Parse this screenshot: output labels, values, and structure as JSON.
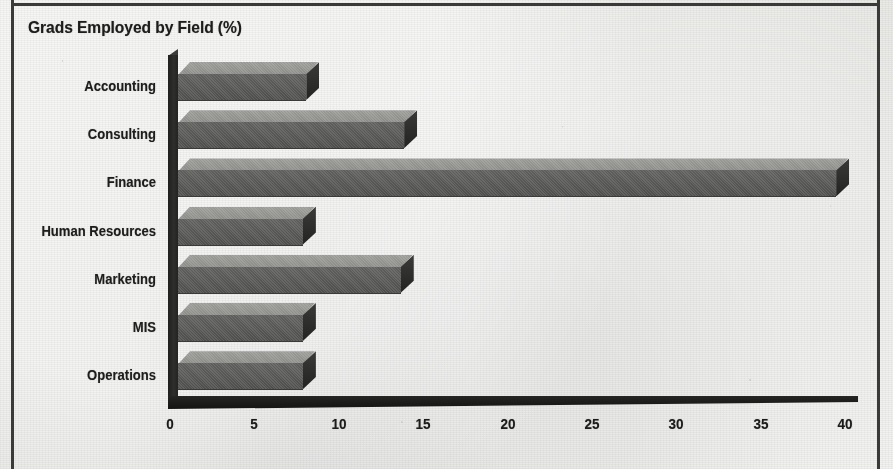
{
  "page": {
    "background_color": "#e9e9e6",
    "frame_color": "#3a3a38"
  },
  "chart_data": {
    "type": "bar",
    "orientation": "horizontal",
    "title": "Grads Employed by Field (%)",
    "xlabel": "",
    "ylabel": "",
    "categories": [
      "Accounting",
      "Consulting",
      "Finance",
      "Human Resources",
      "Marketing",
      "MIS",
      "Operations"
    ],
    "values": [
      7.6,
      13.4,
      39.0,
      7.4,
      13.2,
      7.4,
      7.4
    ],
    "xlim": [
      0,
      40
    ],
    "xticks": [
      0,
      5,
      10,
      15,
      20,
      25,
      30,
      35,
      40
    ],
    "xtick_labels": [
      "0",
      "5",
      "10",
      "15",
      "20",
      "25",
      "30",
      "35",
      "40"
    ],
    "grid": false,
    "legend": null,
    "style": "3d-bar",
    "bar_top_color": "#8b8b88",
    "bar_front_color": "#565654",
    "bar_cap_color": "#252523",
    "axis_color": "#1b1b19"
  }
}
